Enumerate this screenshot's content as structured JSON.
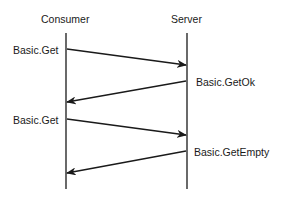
{
  "diagram": {
    "type": "sequence",
    "participants": [
      {
        "name": "Consumer"
      },
      {
        "name": "Server"
      }
    ],
    "messages": [
      {
        "label": "Basic.Get",
        "from": "Consumer",
        "to": "Server"
      },
      {
        "label": "Basic.GetOk",
        "from": "Server",
        "to": "Consumer"
      },
      {
        "label": "Basic.Get",
        "from": "Consumer",
        "to": "Server"
      },
      {
        "label": "Basic.GetEmpty",
        "from": "Server",
        "to": "Consumer"
      }
    ]
  }
}
